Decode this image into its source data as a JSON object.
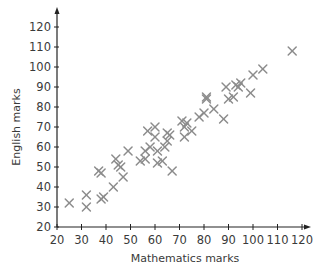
{
  "chart_data": {
    "type": "scatter",
    "title": "",
    "xlabel": "Mathematics marks",
    "ylabel": "English marks",
    "xlim": [
      20,
      120
    ],
    "ylim": [
      20,
      120
    ],
    "x_ticks": [
      20,
      30,
      40,
      50,
      60,
      70,
      80,
      90,
      100,
      110,
      120
    ],
    "y_ticks": [
      20,
      30,
      40,
      50,
      60,
      70,
      80,
      90,
      100,
      110,
      120
    ],
    "x_tick_labels": [
      "20",
      "30",
      "40",
      "50",
      "60",
      "70",
      "80",
      "90",
      "100",
      "110",
      "120"
    ],
    "y_tick_labels": [
      "20",
      "30",
      "40",
      "50",
      "60",
      "70",
      "80",
      "90",
      "100",
      "110",
      "120"
    ],
    "grid": false,
    "legend": null,
    "marker": "x",
    "marker_color": "#8c8c8c",
    "axis_color": "#222222",
    "series": [
      {
        "name": "Students",
        "points": [
          [
            25,
            32
          ],
          [
            32,
            30
          ],
          [
            32,
            36
          ],
          [
            37,
            48
          ],
          [
            38,
            47
          ],
          [
            38,
            34
          ],
          [
            39,
            35
          ],
          [
            43,
            40
          ],
          [
            44,
            54
          ],
          [
            45,
            51
          ],
          [
            46,
            50
          ],
          [
            47,
            45
          ],
          [
            49,
            58
          ],
          [
            54,
            53
          ],
          [
            56,
            54
          ],
          [
            56,
            58
          ],
          [
            57,
            68
          ],
          [
            58,
            60
          ],
          [
            60,
            65
          ],
          [
            60,
            70
          ],
          [
            61,
            52
          ],
          [
            61,
            58
          ],
          [
            63,
            53
          ],
          [
            64,
            60
          ],
          [
            65,
            63
          ],
          [
            65,
            67
          ],
          [
            66,
            66
          ],
          [
            67,
            48
          ],
          [
            71,
            73
          ],
          [
            72,
            65
          ],
          [
            72,
            70
          ],
          [
            73,
            72
          ],
          [
            75,
            68
          ],
          [
            78,
            75
          ],
          [
            80,
            77
          ],
          [
            81,
            85
          ],
          [
            81,
            84
          ],
          [
            84,
            79
          ],
          [
            88,
            74
          ],
          [
            89,
            90
          ],
          [
            90,
            84
          ],
          [
            92,
            85
          ],
          [
            93,
            91
          ],
          [
            94,
            90
          ],
          [
            95,
            92
          ],
          [
            99,
            87
          ],
          [
            100,
            96
          ],
          [
            104,
            99
          ],
          [
            116,
            108
          ]
        ]
      }
    ]
  }
}
